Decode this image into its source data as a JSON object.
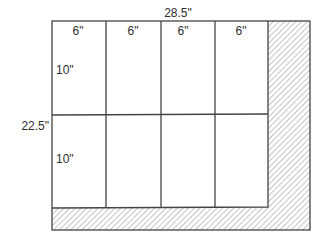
{
  "diagram": {
    "type": "layout-diagram",
    "dimensions": {
      "overall_width": "28.5\"",
      "overall_height": "22.5\""
    },
    "grid": {
      "columns": 4,
      "rows": 2,
      "column_widths": [
        "6\"",
        "6\"",
        "6\"",
        "6\""
      ],
      "row_heights": [
        "10\"",
        "10\""
      ]
    },
    "hatched_region": {
      "shape": "L",
      "sides": [
        "right",
        "bottom"
      ]
    },
    "colors": {
      "line": "#444444",
      "hatch": "#8a8a8a",
      "background": "#ffffff"
    }
  }
}
